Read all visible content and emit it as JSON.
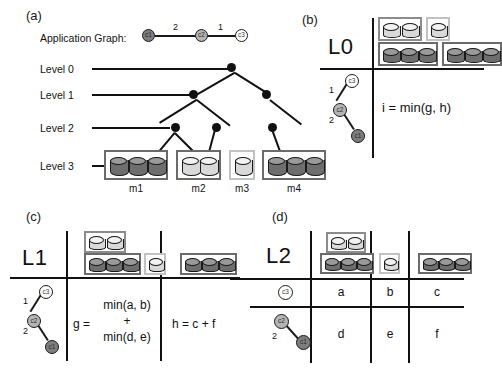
{
  "figure": {
    "panels": [
      {
        "id": "a",
        "label": "(a)"
      },
      {
        "id": "b",
        "label": "(b)"
      },
      {
        "id": "c",
        "label": "(c)"
      },
      {
        "id": "d",
        "label": "(d)"
      }
    ]
  },
  "panel_a": {
    "label": "(a)",
    "app_graph_label": "Application Graph:",
    "app_graph": {
      "nodes": [
        {
          "id": "c1",
          "label": "c1",
          "shade": "dark"
        },
        {
          "id": "c2",
          "label": "c2",
          "shade": "mid"
        },
        {
          "id": "c3",
          "label": "c3",
          "shade": "light"
        }
      ],
      "edges": [
        {
          "from": "c1",
          "to": "c2",
          "weight": "2"
        },
        {
          "from": "c2",
          "to": "c3",
          "weight": "1"
        }
      ]
    },
    "levels": [
      {
        "name": "Level 0"
      },
      {
        "name": "Level 1"
      },
      {
        "name": "Level 2"
      },
      {
        "name": "Level 3"
      }
    ],
    "machines": [
      {
        "name": "m1",
        "disks": 3,
        "shade": "dark"
      },
      {
        "name": "m2",
        "disks": 2,
        "shade": "light"
      },
      {
        "name": "m3",
        "disks": 1,
        "shade": "light"
      },
      {
        "name": "m4",
        "disks": 3,
        "shade": "dark"
      }
    ]
  },
  "panel_b": {
    "label": "(b)",
    "level_label": "L0",
    "formula": "i = min(g, h)",
    "chain": {
      "nodes": [
        {
          "id": "c3",
          "label": "c3",
          "shade": "light"
        },
        {
          "id": "c2",
          "label": "c2",
          "shade": "mid"
        },
        {
          "id": "c1",
          "label": "c1",
          "shade": "dark"
        }
      ],
      "edges": [
        {
          "from": "c3",
          "to": "c2",
          "weight": "1"
        },
        {
          "from": "c2",
          "to": "c1",
          "weight": "2"
        }
      ]
    },
    "groups": [
      {
        "name": "m2",
        "disks": 2,
        "shade": "light"
      },
      {
        "name": "m3",
        "disks": 1,
        "shade": "light"
      },
      {
        "name": "m1",
        "disks": 3,
        "shade": "dark"
      },
      {
        "name": "m4",
        "disks": 3,
        "shade": "dark"
      }
    ]
  },
  "panel_c": {
    "label": "(c)",
    "level_label": "L1",
    "columns": [
      {
        "groups": [
          {
            "name": "m2",
            "disks": 2,
            "shade": "light"
          },
          {
            "name": "m1",
            "disks": 3,
            "shade": "dark"
          },
          {
            "name": "m3",
            "disks": 1,
            "shade": "light"
          }
        ]
      },
      {
        "groups": [
          {
            "name": "m4",
            "disks": 3,
            "shade": "dark"
          }
        ]
      }
    ],
    "chain": {
      "nodes": [
        {
          "id": "c3",
          "label": "c3",
          "shade": "light"
        },
        {
          "id": "c2",
          "label": "c2",
          "shade": "mid"
        },
        {
          "id": "c1",
          "label": "c1",
          "shade": "dark"
        }
      ],
      "edges": [
        {
          "from": "c3",
          "to": "c2",
          "weight": "1"
        },
        {
          "from": "c2",
          "to": "c1",
          "weight": "2"
        }
      ]
    },
    "g_prefix": "g =",
    "g_line1": "min(a, b)",
    "g_line2": "+",
    "g_line3": "min(d, e)",
    "h_formula": "h = c + f"
  },
  "panel_d": {
    "label": "(d)",
    "level_label": "L2",
    "header_groups": [
      {
        "col": 1,
        "groups": [
          {
            "name": "m2",
            "disks": 2,
            "shade": "light"
          },
          {
            "name": "m1",
            "disks": 3,
            "shade": "dark"
          }
        ]
      },
      {
        "col": 2,
        "groups": [
          {
            "name": "m3",
            "disks": 1,
            "shade": "light"
          }
        ]
      },
      {
        "col": 3,
        "groups": [
          {
            "name": "m4",
            "disks": 3,
            "shade": "dark"
          }
        ]
      }
    ],
    "rows": [
      {
        "row_graph": "c3",
        "cells": [
          "a",
          "b",
          "c"
        ]
      },
      {
        "row_graph": "c2-c1",
        "cells": [
          "d",
          "e",
          "f"
        ]
      }
    ],
    "row1_node": {
      "label": "c3",
      "shade": "light"
    },
    "row2_nodes": [
      {
        "label": "c2",
        "shade": "mid"
      },
      {
        "label": "c1",
        "shade": "dark"
      }
    ],
    "row2_edge_weight": "2"
  },
  "colors": {
    "ink": "#111111",
    "disk_dark_body": "#6e6e6e",
    "disk_dark_top": "#9a9a9a",
    "disk_light_body": "#d9d9d9",
    "disk_light_top": "#f2f2f2",
    "box_border": "#8c8c8c",
    "node_c1": "#7d7d7d",
    "node_c2": "#b5b5b5",
    "node_c3": "#ffffff"
  }
}
